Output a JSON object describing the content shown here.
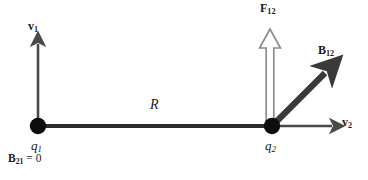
{
  "figure": {
    "background_color": "#ffffff",
    "width": 368,
    "height": 180
  },
  "colors": {
    "charge_dot": "#0d0d0d",
    "separation_line": "#2b2b2b",
    "velocity_arrow": "#4a4a4a",
    "b_field_arrow": "#3a3a3a",
    "force_arrow_outline": "#8c8c8c",
    "force_arrow_fill": "#ffffff",
    "label_text": "#1a1a1a"
  },
  "charges": [
    {
      "id": "q1",
      "label": "q",
      "subscript": "1",
      "x": 38,
      "y": 126,
      "radius": 8
    },
    {
      "id": "q2",
      "label": "q",
      "subscript": "2",
      "x": 272,
      "y": 126,
      "radius": 8
    }
  ],
  "separation": {
    "label": "R",
    "from_x": 38,
    "to_x": 272,
    "y": 126,
    "label_x": 152,
    "label_y": 100
  },
  "vectors": [
    {
      "id": "v1",
      "label": "v",
      "subscript": "1",
      "style": "solid-thin",
      "color": "#4a4a4a",
      "from": [
        38,
        126
      ],
      "to": [
        38,
        38
      ],
      "label_x": 29,
      "label_y": 22
    },
    {
      "id": "v2",
      "label": "v",
      "subscript": "2",
      "style": "solid-thin",
      "color": "#4a4a4a",
      "from": [
        272,
        126
      ],
      "to": [
        338,
        126
      ],
      "label_x": 342,
      "label_y": 118
    },
    {
      "id": "B12",
      "label": "B",
      "subscript": "12",
      "style": "solid-thick",
      "color": "#3a3a3a",
      "from": [
        272,
        126
      ],
      "to": [
        332,
        66
      ],
      "label_x": 318,
      "label_y": 46
    },
    {
      "id": "F12",
      "label": "F",
      "subscript": "12",
      "style": "hollow-outline",
      "color": "#8c8c8c",
      "from": [
        270,
        126
      ],
      "to": [
        270,
        28
      ],
      "label_x": 261,
      "label_y": 3
    }
  ],
  "annotations": [
    {
      "id": "B21-zero",
      "symbol": "B",
      "subscript": "21",
      "equals": " = 0",
      "x": 8,
      "y": 155
    }
  ]
}
